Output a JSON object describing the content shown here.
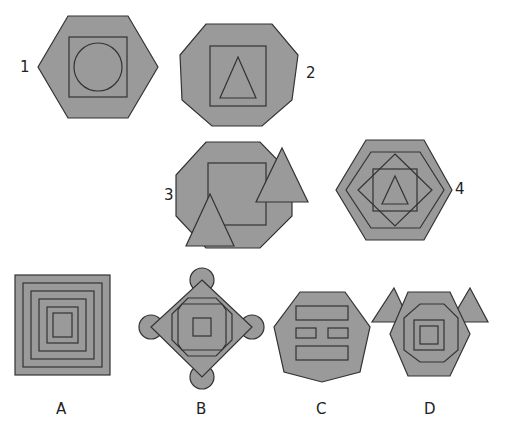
{
  "colors": {
    "fill": "#9a9a9a",
    "stroke": "#333333",
    "background": "#ffffff"
  },
  "question_figures": [
    {
      "label": "1",
      "outer": "hexagon",
      "middle": "square",
      "inner": "circle"
    },
    {
      "label": "2",
      "outer": "heptagon",
      "middle": "square",
      "inner": "triangle"
    },
    {
      "label": "3",
      "outer": "octagon",
      "middle": "square",
      "extras": "two overlapping triangles"
    },
    {
      "label": "4",
      "outer": "hexagon",
      "middle": "hexagon, diamond, square",
      "inner": "triangle"
    }
  ],
  "answer_options": [
    {
      "label": "A",
      "description": "concentric squares"
    },
    {
      "label": "B",
      "description": "diamond with octagon and square, four circles at corners"
    },
    {
      "label": "C",
      "description": "heptagon with rectangle bars"
    },
    {
      "label": "D",
      "description": "hexagon with heptagon, square, two triangles"
    }
  ]
}
